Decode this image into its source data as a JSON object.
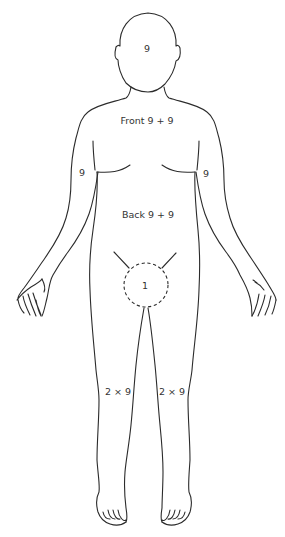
{
  "figure": {
    "stroke_color": "#2b2b2b",
    "text_color": "#333333",
    "labels": {
      "head": "9",
      "front_trunk": "Front 9 + 9",
      "left_arm": "9",
      "right_arm": "9",
      "back_trunk": "Back 9 + 9",
      "perineum": "1",
      "left_leg": "2 × 9",
      "right_leg": "2 × 9"
    }
  }
}
